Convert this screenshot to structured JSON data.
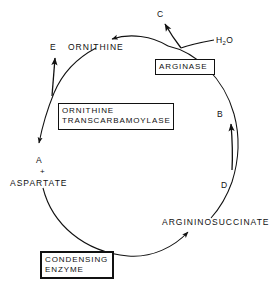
{
  "diagram": {
    "type": "cycle-diagram",
    "stroke_color": "#111111",
    "background_color": "#ffffff",
    "cycle": {
      "center_x": 137,
      "center_y": 145,
      "radius": 103,
      "direction": "counterclockwise"
    },
    "nodes": [
      {
        "id": "A",
        "letter": "A",
        "x": 38,
        "y": 160
      },
      {
        "id": "B",
        "letter": "B",
        "x": 217,
        "y": 114
      },
      {
        "id": "C",
        "letter": "C",
        "x": 157,
        "y": 14
      },
      {
        "id": "D",
        "letter": "D",
        "x": 221,
        "y": 185
      },
      {
        "id": "E",
        "letter": "E",
        "x": 50,
        "y": 47
      }
    ],
    "metabolites": [
      {
        "id": "ornithine",
        "label": "ORNITHINE",
        "x": 68,
        "y": 47
      },
      {
        "id": "aspartate",
        "label": "ASPARTATE",
        "x": 10,
        "y": 183
      },
      {
        "id": "argininosuccinate",
        "label": "ARGININOSUCCINATE",
        "x": 162,
        "y": 222
      }
    ],
    "plus_sign": {
      "label": "+",
      "x": 40,
      "y": 172
    },
    "water": {
      "label": "H",
      "subscript": "2",
      "suffix": "O",
      "x": 218,
      "y": 40
    },
    "enzymes": [
      {
        "id": "arginase",
        "lines": [
          "ARGINASE"
        ],
        "x": 155,
        "y": 59,
        "width": 60,
        "height": 16,
        "emphasis": "normal"
      },
      {
        "id": "ornithine-transcarbamoylase",
        "lines": [
          "ORNITHINE",
          "TRANSCARBAMOYLASE"
        ],
        "x": 58,
        "y": 103,
        "width": 116,
        "height": 27,
        "emphasis": "normal"
      },
      {
        "id": "condensing-enzyme",
        "lines": [
          "CONDENSING",
          "ENZYME"
        ],
        "x": 40,
        "y": 251,
        "width": 74,
        "height": 28,
        "emphasis": "thick"
      }
    ],
    "arrows": [
      {
        "id": "arrow-to-ornithine",
        "from": "C-branch",
        "to": "ornithine",
        "direction": "left"
      },
      {
        "id": "arrow-to-c",
        "from": "cycle-top",
        "to": "C",
        "direction": "up-left"
      },
      {
        "id": "arrow-to-e",
        "from": "cycle-left",
        "to": "E",
        "direction": "up"
      },
      {
        "id": "arrow-to-a",
        "from": "cycle-left",
        "to": "A",
        "direction": "down"
      },
      {
        "id": "arrow-to-b",
        "from": "D-segment",
        "to": "B",
        "direction": "up"
      },
      {
        "id": "arrow-to-argininosuccinate",
        "from": "cycle-bottom",
        "to": "argininosuccinate",
        "direction": "up-right"
      }
    ]
  }
}
